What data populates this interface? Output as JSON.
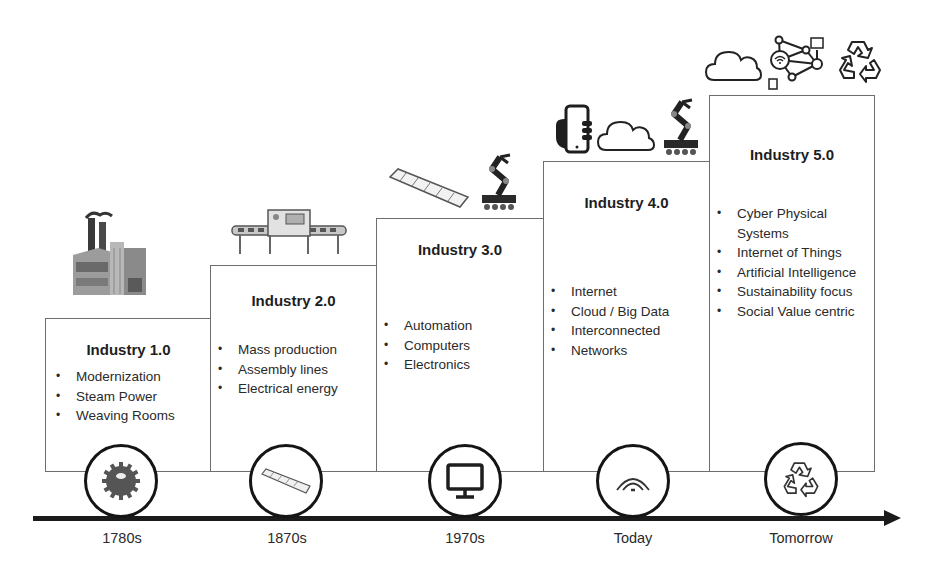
{
  "diagram": {
    "type": "timeline-staircase",
    "stages": [
      {
        "title": "Industry 1.0",
        "bullets": [
          "Modernization",
          "Steam Power",
          "Weaving Rooms"
        ],
        "era": "1780s",
        "circle_icon": "gear-icon",
        "top_illustrations": [
          "factory-icon"
        ]
      },
      {
        "title": "Industry 2.0",
        "bullets": [
          "Mass production",
          "Assembly lines",
          "Electrical energy"
        ],
        "era": "1870s",
        "circle_icon": "conveyor-belt-icon",
        "top_illustrations": [
          "assembly-line-machine-icon"
        ]
      },
      {
        "title": "Industry 3.0",
        "bullets": [
          "Automation",
          "Computers",
          "Electronics"
        ],
        "era": "1970s",
        "circle_icon": "computer-monitor-icon",
        "top_illustrations": [
          "conveyor-belt-icon",
          "robot-arm-icon"
        ]
      },
      {
        "title": "Industry 4.0",
        "bullets": [
          "Internet",
          "Cloud / Big Data",
          "Interconnected",
          "Networks"
        ],
        "era": "Today",
        "circle_icon": "wifi-signal-icon",
        "top_illustrations": [
          "smartphone-hand-icon",
          "cloud-icon",
          "robot-arm-icon"
        ]
      },
      {
        "title": "Industry 5.0",
        "bullets": [
          "Cyber Physical Systems",
          "Internet of Things",
          "Artificial Intelligence",
          "Sustainability focus",
          "Social Value centric"
        ],
        "era": "Tomorrow",
        "circle_icon": "recycle-icon",
        "top_illustrations": [
          "cloud-icon",
          "iot-network-icon",
          "recycle-icon"
        ]
      }
    ],
    "colors": {
      "line": "#1b1b1b",
      "box_border": "#6e6e6e",
      "text": "#2a2a2a"
    }
  }
}
